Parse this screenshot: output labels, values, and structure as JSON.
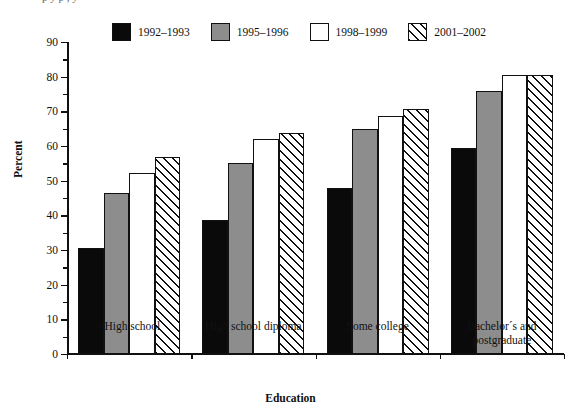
{
  "caption": {
    "clipped_text": "p         y                      p              , y"
  },
  "chart_data": {
    "type": "bar",
    "title": "",
    "xlabel": "Education",
    "ylabel": "Percent",
    "ylim": [
      0,
      90
    ],
    "ytick_values": [
      0,
      10,
      20,
      30,
      40,
      50,
      60,
      70,
      80,
      90
    ],
    "ytick_labels": [
      "0",
      "10",
      "20",
      "30",
      "40",
      "50",
      "60",
      "70",
      "80",
      "90"
    ],
    "yminor_step": 5,
    "grid": false,
    "legend_position": "top",
    "categories": [
      "<High school",
      "High school diploma",
      "Some college",
      "Bachelor´s and\npostgraduate"
    ],
    "series": [
      {
        "name": "1992–1993",
        "fill": "solid-black",
        "color": "#0a0a0a",
        "values": [
          30.5,
          38.7,
          48.0,
          59.3
        ]
      },
      {
        "name": "1995–1996",
        "fill": "gray",
        "color": "#8d8d8d",
        "values": [
          46.5,
          55.0,
          65.0,
          75.8
        ]
      },
      {
        "name": "1998–1999",
        "fill": "white",
        "color": "#ffffff",
        "values": [
          52.2,
          62.0,
          68.7,
          80.5
        ]
      },
      {
        "name": "2001–2002",
        "fill": "diagonal-hatch",
        "color": "#ffffff",
        "values": [
          56.9,
          63.8,
          70.6,
          80.6
        ]
      }
    ]
  },
  "legend": {
    "items": [
      {
        "label": "1992–1993",
        "fill": "solid-black"
      },
      {
        "label": "1995–1996",
        "fill": "gray"
      },
      {
        "label": "1998–1999",
        "fill": "white"
      },
      {
        "label": "2001–2002",
        "fill": "diagonal-hatch"
      }
    ]
  },
  "axes": {
    "x_title": "Education",
    "y_title": "Percent"
  },
  "colors": {
    "ink": "#111111",
    "series_black": "#0a0a0a",
    "series_gray": "#8d8d8d",
    "series_white": "#ffffff",
    "background": "#ffffff"
  }
}
